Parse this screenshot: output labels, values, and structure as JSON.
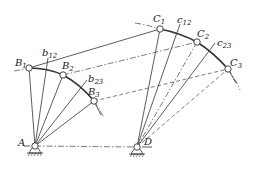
{
  "figure": {
    "labels": {
      "A": "A",
      "D": "D",
      "B1": "B",
      "B1_sub": "1",
      "B2": "B",
      "B2_sub": "2",
      "B3": "B",
      "B3_sub": "3",
      "C1": "C",
      "C1_sub": "1",
      "C2": "C",
      "C2_sub": "2",
      "C3": "C",
      "C3_sub": "3",
      "b12": "b",
      "b12_sub": "12",
      "b23": "b",
      "b23_sub": "23",
      "c12": "c",
      "c12_sub": "12",
      "c23": "c",
      "c23_sub": "23"
    },
    "points": {
      "A": [
        35,
        146
      ],
      "D": [
        137,
        147
      ],
      "B1": [
        29,
        68
      ],
      "B2": [
        63,
        75
      ],
      "B3": [
        94,
        101
      ],
      "C1": [
        160,
        29
      ],
      "C2": [
        197,
        42
      ],
      "C3": [
        228,
        69
      ]
    },
    "colors": {
      "line": "#333333",
      "background": "#ffffff"
    }
  }
}
